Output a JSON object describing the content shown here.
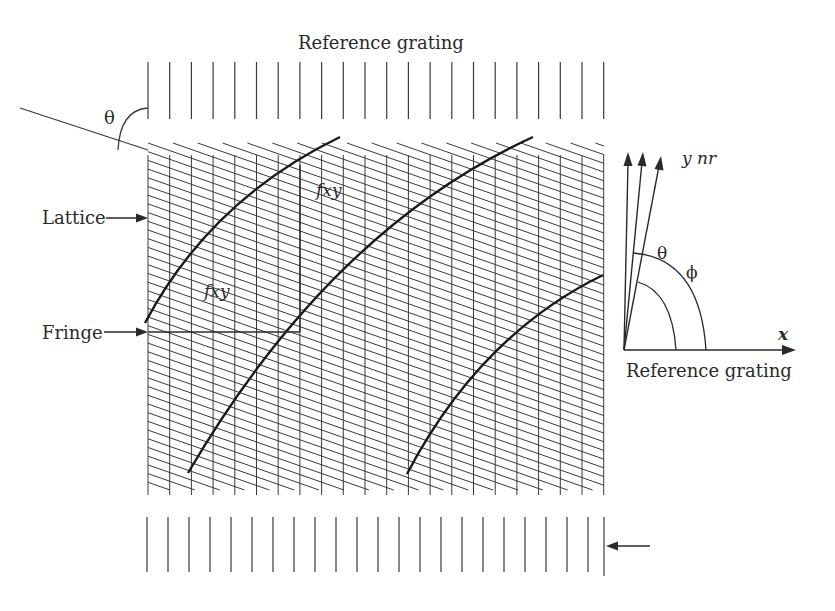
{
  "labels": {
    "top_title": "Reference grating",
    "theta_top": "θ",
    "lattice": "Lattice",
    "fringe": "Fringe",
    "fxy_vertical": "fxy",
    "fxy_horizontal": "fxy",
    "axis_y": "y nr",
    "axis_x": "x",
    "angle_theta": "θ",
    "angle_phi": "ϕ",
    "axis_caption": "Reference grating"
  },
  "colors": {
    "line": "#3a3a3a",
    "fringe": "#1a1a1a",
    "text": "#2a2a2a"
  },
  "geometry": {
    "top_grating": {
      "x_start": 148,
      "spacing": 21.7,
      "count": 22,
      "y1": 62,
      "y2": 119
    },
    "bottom_grating": {
      "x_start": 147,
      "spacing": 21.0,
      "count": 22,
      "y1": 517,
      "y2": 572,
      "last_x": 589
    },
    "lattice": {
      "x_start": 148,
      "spacing": 21.7,
      "count": 22,
      "y_top": 155,
      "y_bottom": 495,
      "right_x": 604
    },
    "slants": {
      "slope": 0.35,
      "group_starts": [
        150,
        215,
        280,
        345,
        410,
        475,
        540
      ],
      "y_top": 143,
      "row_spacing": 8.7
    },
    "origin": {
      "x": 624,
      "y": 350
    }
  }
}
